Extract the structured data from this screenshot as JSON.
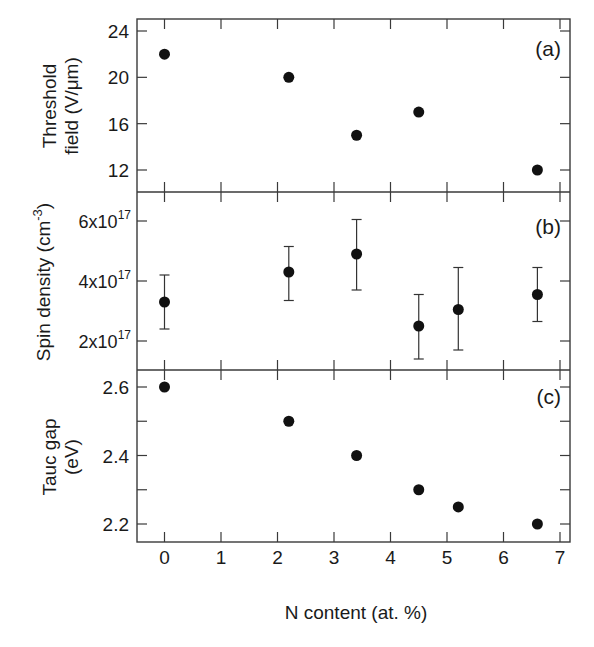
{
  "chart_data": {
    "type": "scatter",
    "layout": "three vertically stacked panels sharing x-axis",
    "xlabel": "N content (at. %)",
    "xlim": [
      -0.5,
      7.1
    ],
    "xticks": [
      0,
      1,
      2,
      3,
      4,
      5,
      6,
      7
    ],
    "grid": false,
    "legend": null,
    "panels": [
      {
        "id": "a",
        "annotation": "(a)",
        "ylabel_line1": "Threshold",
        "ylabel_line2": "field (V/μm)",
        "ylim": [
          10.1,
          24.9
        ],
        "yticks": [
          12,
          16,
          20,
          24
        ],
        "ytick_labels": [
          "12",
          "16",
          "20",
          "24"
        ],
        "series": [
          {
            "name": "Threshold field",
            "x": [
              0,
              2.2,
              3.4,
              4.5,
              6.6
            ],
            "y": [
              22,
              20,
              15,
              17,
              12
            ]
          }
        ]
      },
      {
        "id": "b",
        "annotation": "(b)",
        "ylabel": "Spin density (cm",
        "ylabel_sup": "-3",
        "ylabel_close": ")",
        "ylim": [
          9.5e+16,
          7e+17
        ],
        "yticks": [
          2e+17,
          4e+17,
          6e+17
        ],
        "ytick_labels": [
          {
            "base": "2x10",
            "exp": "17"
          },
          {
            "base": "4x10",
            "exp": "17"
          },
          {
            "base": "6x10",
            "exp": "17"
          }
        ],
        "series": [
          {
            "name": "Spin density",
            "x": [
              0,
              2.2,
              3.4,
              4.5,
              5.2,
              6.6
            ],
            "y": [
              3.3e+17,
              4.3e+17,
              4.9e+17,
              2.5e+17,
              3.05e+17,
              3.55e+17
            ],
            "y_err_high": [
              4.2e+17,
              5.15e+17,
              6.05e+17,
              3.55e+17,
              4.45e+17,
              4.45e+17
            ],
            "y_err_low": [
              2.4e+17,
              3.35e+17,
              3.7e+17,
              1.4e+17,
              1.7e+17,
              2.65e+17
            ]
          }
        ]
      },
      {
        "id": "c",
        "annotation": "(c)",
        "ylabel_line1": "Tauc gap",
        "ylabel_line2": "(eV)",
        "ylim": [
          2.15,
          2.655
        ],
        "yticks": [
          2.2,
          2.3,
          2.4,
          2.5,
          2.6
        ],
        "ytick_labels": [
          "2.2",
          "",
          "2.4",
          "",
          "2.6"
        ],
        "series": [
          {
            "name": "Tauc gap",
            "x": [
              0,
              2.2,
              3.4,
              4.5,
              5.2,
              6.6
            ],
            "y": [
              2.6,
              2.5,
              2.4,
              2.3,
              2.25,
              2.2
            ]
          }
        ]
      }
    ]
  },
  "labels": {
    "xlabel": "N content (at. %)",
    "panel_a": "(a)",
    "panel_b": "(b)",
    "panel_c": "(c)",
    "a_ylabel_1": "Threshold",
    "a_ylabel_2": "field (V/μm)",
    "b_ylabel": "Spin density (cm",
    "b_ylabel_sup": "-3",
    "b_ylabel_close": ")",
    "c_ylabel_1": "Tauc gap",
    "c_ylabel_2": "(eV)"
  }
}
